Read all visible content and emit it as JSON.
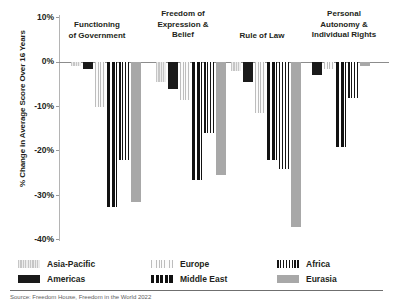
{
  "chart_data": {
    "type": "bar",
    "title": "",
    "xlabel": "",
    "ylabel": "% Change in Average Score Over 16 Years",
    "ylim": [
      -40,
      10
    ],
    "yticks": [
      "10%",
      "0%",
      "-10%",
      "-20%",
      "-30%",
      "-40%"
    ],
    "ytick_values": [
      10,
      0,
      -10,
      -20,
      -30,
      -40
    ],
    "grid": false,
    "legend_position": "bottom",
    "categories": [
      "Functioning of Government",
      "Freedom of Expression & Belief",
      "Rule of Law",
      "Personal Autonomy & Individual Rights"
    ],
    "category_labels": [
      [
        "Functioning",
        "of Government"
      ],
      [
        "Freedom of",
        "Expression &",
        "Belief"
      ],
      [
        "Rule of Law"
      ],
      [
        "Personal",
        "Autonomy &",
        "Individual Rights"
      ]
    ],
    "series": [
      {
        "name": "Asia-Pacific",
        "pattern": "light-gray-vertical-stripes",
        "values": [
          -1.0,
          -4.5,
          -2.0,
          null
        ]
      },
      {
        "name": "Americas",
        "pattern": "solid-black",
        "values": [
          -1.5,
          -6.0,
          -4.5,
          -3.0
        ]
      },
      {
        "name": "Europe",
        "pattern": "fine-light-vertical-stripes",
        "values": [
          -10.0,
          -8.5,
          -11.5,
          -1.5
        ]
      },
      {
        "name": "Middle East",
        "pattern": "thick-black-vertical-bars",
        "values": [
          -32.5,
          -26.5,
          -22.0,
          -19.0
        ]
      },
      {
        "name": "Africa",
        "pattern": "black-vertical-stripes",
        "values": [
          -22.0,
          -16.0,
          -24.0,
          -8.0
        ]
      },
      {
        "name": "Eurasia",
        "pattern": "solid-medium-gray",
        "values": [
          -31.5,
          -25.5,
          -37.0,
          -1.0
        ]
      }
    ]
  },
  "legend": {
    "entries": [
      {
        "label": "Asia-Pacific",
        "swatch": "swatch-asia-pacific"
      },
      {
        "label": "Americas",
        "swatch": "swatch-americas"
      },
      {
        "label": "Europe",
        "swatch": "swatch-europe"
      },
      {
        "label": "Middle East",
        "swatch": "swatch-middle-east"
      },
      {
        "label": "Africa",
        "swatch": "swatch-africa"
      },
      {
        "label": "Eurasia",
        "swatch": "swatch-eurasia"
      }
    ]
  },
  "footer": {
    "source": "Source: Freedom House, Freedom in the World 2022"
  },
  "colors": {
    "axis": "#8c8c8c",
    "text": "#231f20",
    "black": "#1a1a1a",
    "gray": "#a8a8a8",
    "light_gray": "#d9d9d9"
  }
}
